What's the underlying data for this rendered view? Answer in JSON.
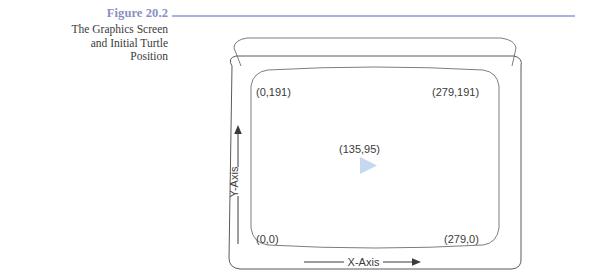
{
  "figure": {
    "number": "Figure 20.2",
    "title_lines": [
      "The Graphics Screen",
      "and Initial Turtle",
      "Position"
    ],
    "number_color": "#8a8fc4",
    "rule_color": "#aab0df"
  },
  "diagram": {
    "name": "graphics-screen-diagram",
    "coordinates": {
      "top_left": "(0,191)",
      "top_right": "(279,191)",
      "bottom_left": "(0,0)",
      "bottom_right": "(279,0)",
      "center": "(135,95)"
    },
    "axes": {
      "x_label": "X-Axis",
      "y_label": "Y-Axis"
    },
    "turtle": {
      "shape": "triangle-right",
      "color": "#c6d8ef"
    },
    "outline_color": "#5a5a5a"
  }
}
